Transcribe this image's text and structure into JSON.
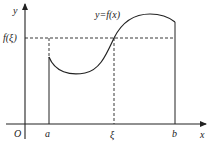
{
  "diagram": {
    "labels": {
      "y_axis": "y",
      "x_axis": "x",
      "origin": "O",
      "a": "a",
      "b": "b",
      "xi": "ξ",
      "f_xi": "f(ξ)",
      "curve": "y=f(x)"
    },
    "colors": {
      "stroke": "#222222",
      "background": "#ffffff"
    }
  }
}
